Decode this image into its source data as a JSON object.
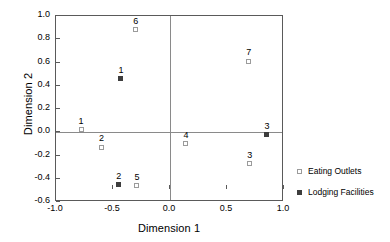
{
  "chart_data": {
    "type": "scatter",
    "title": "",
    "xlabel": "Dimension 1",
    "ylabel": "Dimension 2",
    "xlim": [
      -1.0,
      1.0
    ],
    "ylim": [
      -0.6,
      1.0
    ],
    "xticks": [
      "-1.0",
      "-0.5",
      "0.0",
      "0.5",
      "1.0"
    ],
    "xtickvalues": [
      -1.0,
      -0.5,
      0.0,
      0.5,
      1.0
    ],
    "yticks": [
      "-0.6",
      "-0.4",
      "-0.2",
      "0.0",
      "0.2",
      "0.4",
      "0.6",
      "0.8",
      "1.0"
    ],
    "ytickvalues": [
      -0.6,
      -0.4,
      -0.2,
      0.0,
      0.2,
      0.4,
      0.6,
      0.8,
      1.0
    ],
    "grid": false,
    "zero_lines": true,
    "legend_position": "right",
    "series": [
      {
        "name": "Eating Outlets",
        "marker": "open-square",
        "color": "#9b9b9b",
        "points": [
          {
            "label": "1",
            "x": -0.78,
            "y": 0.02
          },
          {
            "label": "2",
            "x": -0.6,
            "y": -0.13
          },
          {
            "label": "3",
            "x": 0.7,
            "y": -0.27
          },
          {
            "label": "4",
            "x": 0.14,
            "y": -0.1
          },
          {
            "label": "5",
            "x": -0.29,
            "y": -0.46
          },
          {
            "label": "6",
            "x": -0.3,
            "y": 0.88
          },
          {
            "label": "7",
            "x": 0.69,
            "y": 0.61
          }
        ]
      },
      {
        "name": "Lodging Facilities",
        "marker": "filled-square",
        "color": "#3d3d3d",
        "points": [
          {
            "label": "1",
            "x": -0.43,
            "y": 0.46
          },
          {
            "label": "2",
            "x": -0.45,
            "y": -0.45
          },
          {
            "label": "3",
            "x": 0.85,
            "y": -0.02
          }
        ]
      }
    ]
  },
  "legend": {
    "entries": [
      {
        "label": "Eating Outlets",
        "marker": "open-square"
      },
      {
        "label": "Lodging Facilities",
        "marker": "filled-square"
      }
    ]
  }
}
